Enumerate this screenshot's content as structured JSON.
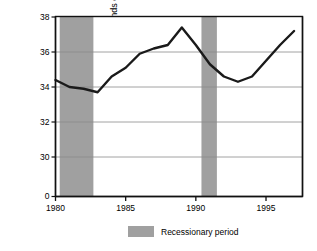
{
  "chart_data": {
    "type": "line",
    "title": "",
    "subtitle": "",
    "xlabel": "",
    "ylabel": "Income in thousands of 1997 dollars",
    "xlim": [
      1980,
      1997.6
    ],
    "ylim": [
      29.0,
      38.0
    ],
    "y_axis_broken": true,
    "y_break_note": "axis shows 0 at baseline then jumps to 30",
    "yticks": [
      0,
      30,
      32,
      34,
      36,
      38
    ],
    "ytick_labels": [
      "0",
      "30",
      "32",
      "34",
      "36",
      "38"
    ],
    "xticks": [
      1980,
      1985,
      1990,
      1995
    ],
    "xtick_labels": [
      "1980",
      "1985",
      "1990",
      "1995"
    ],
    "grid": true,
    "grid_axis": "y",
    "legend_position": "below-center",
    "legend": [
      {
        "label": "Recessionary period",
        "color": "#a0a0a0",
        "type": "band"
      }
    ],
    "series": [
      {
        "name": "Median household income",
        "color": "#1a1a1a",
        "line_width": 2.4,
        "x": [
          1980,
          1981,
          1982,
          1983,
          1984,
          1985,
          1986,
          1987,
          1988,
          1989,
          1990,
          1991,
          1992,
          1993,
          1994,
          1995,
          1996,
          1997
        ],
        "values": [
          34.4,
          34.0,
          33.9,
          33.7,
          34.6,
          35.1,
          35.9,
          36.2,
          36.4,
          37.4,
          36.4,
          35.3,
          34.6,
          34.3,
          34.6,
          35.5,
          36.4,
          37.2
        ]
      }
    ],
    "bands": [
      {
        "label": "Recessionary period",
        "x_start": 1980.3,
        "x_end": 1982.7,
        "color": "#a0a0a0"
      },
      {
        "label": "Recessionary period",
        "x_start": 1990.4,
        "x_end": 1991.5,
        "color": "#a0a0a0"
      }
    ]
  },
  "legend": {
    "swatch_name": "recession-band-swatch",
    "label": "Recessionary period"
  },
  "axis": {
    "y_title": "Income in thousands of 1997 dollars"
  }
}
